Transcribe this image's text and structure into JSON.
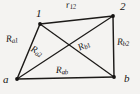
{
  "figure": {
    "kind": "quadrilateral-with-diagonals",
    "background_color": "#f4f3f1",
    "ink_color": "#1c1a18",
    "vertices": [
      {
        "id": "v1",
        "name": "1",
        "label": "1",
        "x": 40,
        "y": 24
      },
      {
        "id": "v2",
        "name": "2",
        "label": "2",
        "x": 113,
        "y": 16
      },
      {
        "id": "va",
        "name": "a",
        "label": "a",
        "x": 17,
        "y": 79
      },
      {
        "id": "vb",
        "name": "b",
        "label": "b",
        "x": 114,
        "y": 77
      }
    ],
    "segments": [
      {
        "id": "r12",
        "base": "r",
        "sub": "12",
        "from": "v1",
        "to": "v2",
        "kind": "edge"
      },
      {
        "id": "ra1",
        "base": "R",
        "sub": "a1",
        "from": "va",
        "to": "v1",
        "kind": "edge"
      },
      {
        "id": "rb2",
        "base": "R",
        "sub": "b2",
        "from": "v2",
        "to": "vb",
        "kind": "edge"
      },
      {
        "id": "rab",
        "base": "R",
        "sub": "ab",
        "from": "va",
        "to": "vb",
        "kind": "edge"
      },
      {
        "id": "ra2",
        "base": "R",
        "sub": "a2",
        "from": "va",
        "to": "v2",
        "kind": "diagonal"
      },
      {
        "id": "rb1",
        "base": "R",
        "sub": "b1",
        "from": "v1",
        "to": "vb",
        "kind": "diagonal"
      }
    ],
    "labels": {
      "v1": "1",
      "v2": "2",
      "va": "a",
      "vb": "b",
      "r12_base": "r",
      "r12_sub": "12",
      "ra1_base": "R",
      "ra1_sub": "a1",
      "ra2_base": "R",
      "ra2_sub": "a2",
      "rb1_base": "R",
      "rb1_sub": "b1",
      "rb2_base": "R",
      "rb2_sub": "b2",
      "rab_base": "R",
      "rab_sub": "ab"
    }
  }
}
